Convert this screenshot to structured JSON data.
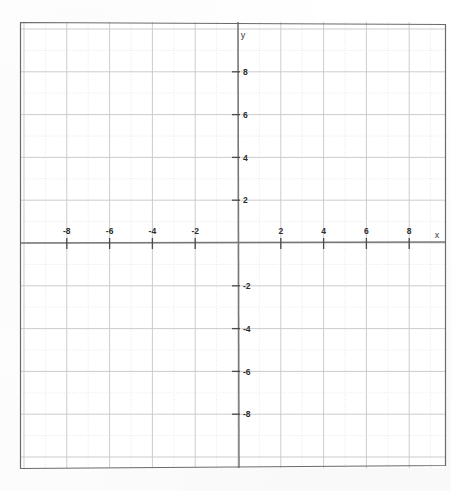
{
  "figure": {
    "kind": "cartesian-coordinate-grid",
    "background_color": "#fefefe",
    "border_color": "#6a6a6a",
    "axis_color": "#777777",
    "grid_major_color": "#c9c9c9",
    "grid_minor_color": "#d9d9d9",
    "label_color": "#2b2b2b"
  },
  "axis_labels": {
    "x": "x",
    "y": "y"
  },
  "chart_data": {
    "type": "scatter",
    "title": "",
    "subtitle": "",
    "xlabel": "x",
    "ylabel": "y",
    "xlim": [
      -10,
      10
    ],
    "ylim": [
      -10,
      10
    ],
    "grid": true,
    "grid_step": 1,
    "legend": null,
    "legend_position": "none",
    "series": [],
    "annotations": [],
    "xticks": [
      -8,
      -6,
      -4,
      -2,
      2,
      4,
      6,
      8
    ],
    "yticks": [
      8,
      6,
      4,
      2,
      -2,
      -4,
      -6,
      -8
    ],
    "xtick_labels": [
      "-8",
      "-6",
      "-4",
      "-2",
      "2",
      "4",
      "6",
      "8"
    ],
    "ytick_labels": [
      "8",
      "6",
      "4",
      "2",
      "-2",
      "-4",
      "-6",
      "-8"
    ],
    "x_tick_label_position": "above-axis",
    "y_tick_label_position": "right-of-axis",
    "values": [],
    "x": [],
    "origin_label": ""
  },
  "x_ticks": [
    {
      "value": -8,
      "label": "-8"
    },
    {
      "value": -6,
      "label": "-6"
    },
    {
      "value": -4,
      "label": "-4"
    },
    {
      "value": -2,
      "label": "-2"
    },
    {
      "value": 2,
      "label": "2"
    },
    {
      "value": 4,
      "label": "4"
    },
    {
      "value": 6,
      "label": "6"
    },
    {
      "value": 8,
      "label": "8"
    }
  ],
  "y_ticks": [
    {
      "value": 8,
      "label": "8"
    },
    {
      "value": 6,
      "label": "6"
    },
    {
      "value": 4,
      "label": "4"
    },
    {
      "value": 2,
      "label": "2"
    },
    {
      "value": -2,
      "label": "-2"
    },
    {
      "value": -4,
      "label": "-4"
    },
    {
      "value": -6,
      "label": "-6"
    },
    {
      "value": -8,
      "label": "-8"
    }
  ]
}
